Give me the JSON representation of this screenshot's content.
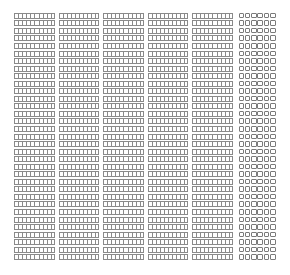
{
  "grid": {
    "columns": 6,
    "rows": 33,
    "columns_spec": [
      {
        "type": "narrow",
        "glyphs_per_cell": 10
      },
      {
        "type": "narrow",
        "glyphs_per_cell": 10
      },
      {
        "type": "narrow",
        "glyphs_per_cell": 10
      },
      {
        "type": "narrow",
        "glyphs_per_cell": 10
      },
      {
        "type": "narrow",
        "glyphs_per_cell": 10
      },
      {
        "type": "wide",
        "glyphs_per_cell": 6
      }
    ],
    "glyph": "missing-glyph-box",
    "glyph_color": "#8a8a8a",
    "background": "#ffffff"
  }
}
